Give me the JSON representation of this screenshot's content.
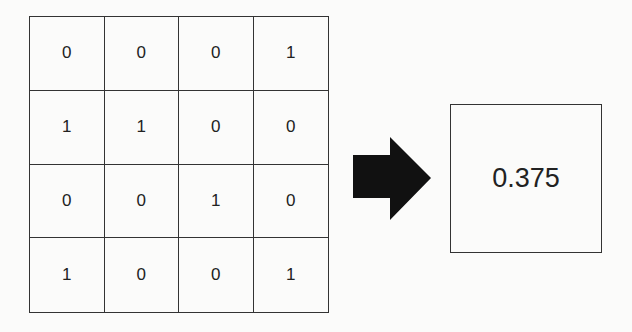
{
  "matrix": {
    "rows": [
      [
        "0",
        "0",
        "0",
        "1"
      ],
      [
        "1",
        "1",
        "0",
        "0"
      ],
      [
        "0",
        "0",
        "1",
        "0"
      ],
      [
        "1",
        "0",
        "0",
        "1"
      ]
    ]
  },
  "arrow": {
    "icon": "right-arrow-icon",
    "color": "#111111"
  },
  "result": {
    "value": "0.375"
  }
}
